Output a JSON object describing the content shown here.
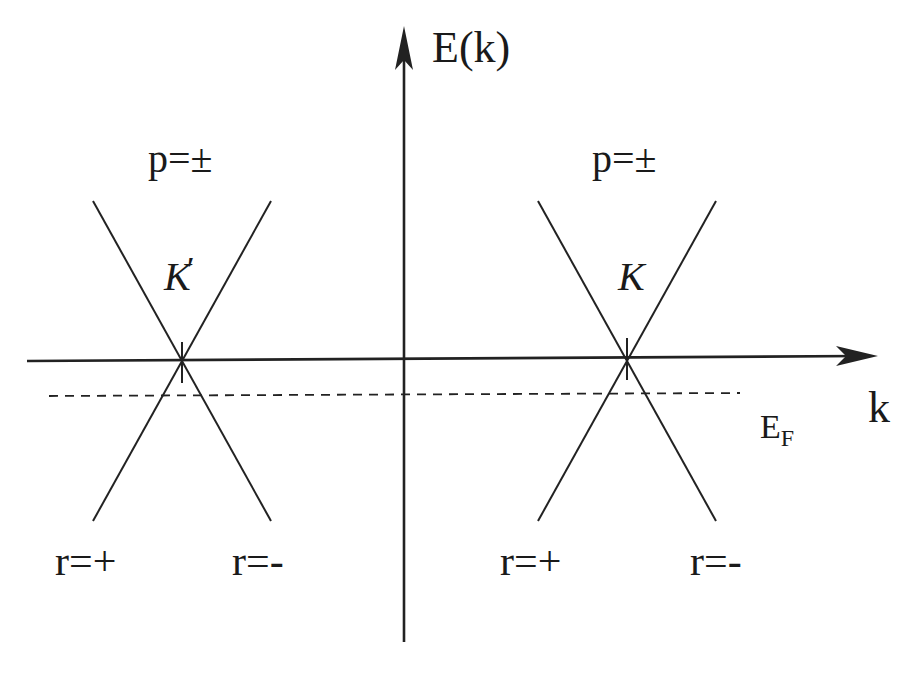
{
  "diagram": {
    "axes": {
      "y_label": "E(k)",
      "x_label": "k"
    },
    "fermi_level": {
      "label_main": "E",
      "label_sub": "F"
    },
    "cones": [
      {
        "point_label": "K",
        "prime": "′",
        "pseudospin_label": "p=±",
        "branch_left": "r=+",
        "branch_right": "r=-"
      },
      {
        "point_label": "K",
        "prime": "",
        "pseudospin_label": "p=±",
        "branch_left": "r=+",
        "branch_right": "r=-"
      }
    ],
    "colors": {
      "line": "#222222",
      "background": "#ffffff"
    }
  }
}
